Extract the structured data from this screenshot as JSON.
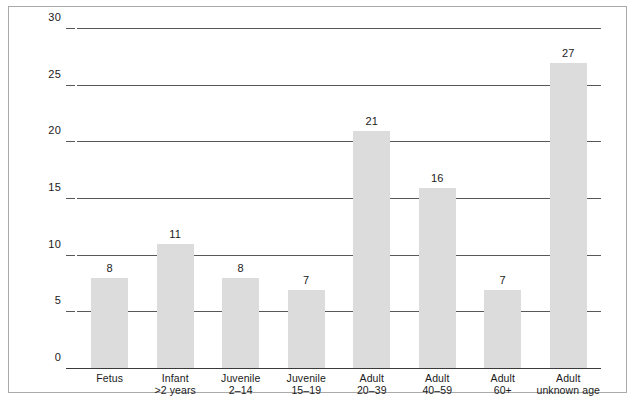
{
  "chart_data": {
    "type": "bar",
    "title": "",
    "xlabel": "",
    "ylabel": "",
    "categories": [
      "Fetus",
      "Infant >2 years",
      "Juvenile 2–14",
      "Juvenile 15–19",
      "Adult 20–39",
      "Adult 40–59",
      "Adult 60+",
      "Adult unknown age"
    ],
    "category_lines": [
      [
        "Fetus"
      ],
      [
        "Infant",
        ">2 years"
      ],
      [
        "Juvenile",
        "2–14"
      ],
      [
        "Juvenile",
        "15–19"
      ],
      [
        "Adult",
        "20–39"
      ],
      [
        "Adult",
        "40–59"
      ],
      [
        "Adult",
        "60+"
      ],
      [
        "Adult",
        "unknown age"
      ]
    ],
    "values": [
      8,
      11,
      8,
      7,
      21,
      16,
      7,
      27
    ],
    "ylim": [
      0,
      30
    ],
    "yticks": [
      0,
      5,
      10,
      15,
      20,
      25,
      30
    ],
    "ytick_labels": [
      "0",
      "5",
      "10",
      "15",
      "20",
      "25",
      "30"
    ],
    "grid": true,
    "legend": false,
    "legend_position": "none",
    "bar_color": "#dcdcdc",
    "gridline_color": "#58585a",
    "axis_color": "#3a3a3c",
    "text_color": "#1a1a1a",
    "background_color": "#ffffff",
    "frame_border_color": "#aaaaaa"
  }
}
